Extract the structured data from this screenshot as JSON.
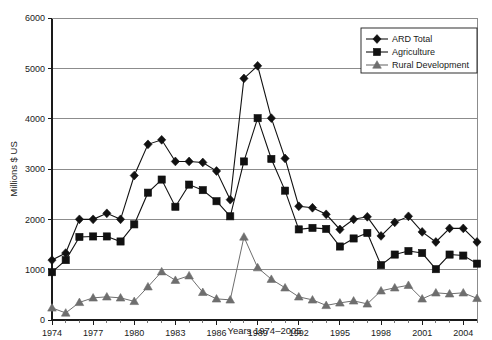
{
  "chart_data": {
    "type": "line",
    "title": "",
    "xlabel": "Years 1974–2005",
    "ylabel": "Millions $ US",
    "ylim": [
      0,
      6000
    ],
    "ytick_values": [
      0,
      1000,
      2000,
      3000,
      4000,
      5000,
      6000
    ],
    "ytick_labels": [
      "0",
      "1000",
      "2000",
      "3000",
      "4000",
      "5000",
      "6000"
    ],
    "xlim": [
      1974,
      2005
    ],
    "xtick_values": [
      1974,
      1977,
      1980,
      1983,
      1986,
      1989,
      1992,
      1995,
      1998,
      2001,
      2004
    ],
    "xtick_labels": [
      "1974",
      "1977",
      "1980",
      "1983",
      "1986",
      "1989",
      "1992",
      "1995",
      "1998",
      "2001",
      "2004"
    ],
    "grid": "horizontal",
    "legend_position": "top-right",
    "x": [
      1974,
      1975,
      1976,
      1977,
      1978,
      1979,
      1980,
      1981,
      1982,
      1983,
      1984,
      1985,
      1986,
      1987,
      1988,
      1989,
      1990,
      1991,
      1992,
      1993,
      1994,
      1995,
      1996,
      1997,
      1998,
      1999,
      2000,
      2001,
      2002,
      2003,
      2004,
      2005
    ],
    "series": [
      {
        "name": "ARD Total",
        "marker": "diamond",
        "color": "#111111",
        "values": [
          1190,
          1330,
          2000,
          2000,
          2120,
          2000,
          2870,
          3490,
          3580,
          3150,
          3150,
          3130,
          2960,
          2390,
          4800,
          5050,
          4010,
          3210,
          2260,
          2230,
          2100,
          1800,
          2000,
          2050,
          1670,
          1940,
          2060,
          1750,
          1550,
          1820,
          1820,
          1550
        ]
      },
      {
        "name": "Agriculture",
        "marker": "square",
        "color": "#111111",
        "values": [
          950,
          1190,
          1650,
          1660,
          1660,
          1560,
          1900,
          2530,
          2790,
          2250,
          2690,
          2580,
          2360,
          2060,
          3150,
          4010,
          3200,
          2570,
          1800,
          1830,
          1810,
          1460,
          1620,
          1730,
          1090,
          1300,
          1370,
          1330,
          1010,
          1300,
          1280,
          1120
        ]
      },
      {
        "name": "Rural Development",
        "marker": "triangle",
        "color": "#6e6e6e",
        "values": [
          240,
          140,
          350,
          440,
          460,
          440,
          370,
          660,
          960,
          790,
          880,
          550,
          420,
          400,
          1650,
          1040,
          810,
          640,
          460,
          400,
          290,
          340,
          380,
          320,
          580,
          640,
          690,
          420,
          540,
          520,
          540,
          430
        ]
      }
    ]
  }
}
